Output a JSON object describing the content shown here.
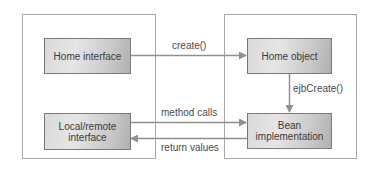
{
  "diagram": {
    "containers": [
      {
        "id": "client-container"
      },
      {
        "id": "server-container"
      }
    ],
    "boxes": {
      "home_interface": "Home interface",
      "local_remote_interface": "Local/remote\ninterface",
      "home_object": "Home object",
      "bean_implementation": "Bean\nimplementation"
    },
    "arrows": {
      "create": "create()",
      "ejb_create": "ejbCreate()",
      "method_calls": "method calls",
      "return_values": "return values"
    },
    "colors": {
      "line": "#909090",
      "container_border": "#a8a8a8",
      "box_border": "#7a7a7a",
      "text": "#3a3a3a"
    }
  }
}
